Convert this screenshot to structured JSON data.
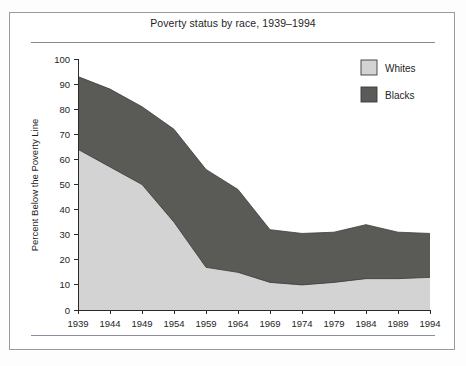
{
  "figure": {
    "title": "Poverty status by race, 1939–1994"
  },
  "axes": {
    "ylabel": "Percent Below the Poverty Line",
    "xlabel": "",
    "y_ticks": [
      "0",
      "10",
      "20",
      "30",
      "40",
      "50",
      "60",
      "70",
      "80",
      "90",
      "100"
    ],
    "x_ticks": [
      "1939",
      "1944",
      "1949",
      "1954",
      "1959",
      "1964",
      "1969",
      "1974",
      "1979",
      "1984",
      "1989",
      "1994"
    ]
  },
  "legend": {
    "position": "top-right",
    "entries": [
      {
        "label": "Whites",
        "color": "#d3d3d3"
      },
      {
        "label": "Blacks",
        "color": "#5a5a56"
      }
    ]
  },
  "colors": {
    "whites_fill": "#d3d3d3",
    "blacks_fill": "#5a5a56",
    "outline": "#3a3a3a",
    "axis": "#2a2a2a",
    "frame": "#9a9a9a",
    "page_background": "#ffffff"
  },
  "chart_data": {
    "type": "area",
    "stacked": false,
    "title": "Poverty status by race, 1939–1994",
    "xlabel": "",
    "ylabel": "Percent Below the Poverty Line",
    "xlim": [
      1939,
      1994
    ],
    "ylim": [
      0,
      100
    ],
    "grid": false,
    "legend_position": "top-right",
    "x": [
      1939,
      1944,
      1949,
      1954,
      1959,
      1964,
      1969,
      1974,
      1979,
      1984,
      1989,
      1994
    ],
    "categories": [
      "1939",
      "1944",
      "1949",
      "1954",
      "1959",
      "1964",
      "1969",
      "1974",
      "1979",
      "1984",
      "1989",
      "1994"
    ],
    "series": [
      {
        "name": "Blacks",
        "color": "#5a5a56",
        "note": "upper boundary of the dark band (percent below poverty line for Blacks)",
        "values": [
          93,
          88,
          81,
          72,
          56,
          48,
          32,
          30.5,
          31,
          34,
          31,
          30.5
        ]
      },
      {
        "name": "Whites",
        "color": "#d3d3d3",
        "note": "upper boundary of the light band (percent below poverty line for Whites)",
        "values": [
          64,
          57,
          50,
          35,
          17,
          15,
          11,
          10,
          11,
          12.5,
          12.5,
          13
        ]
      }
    ]
  }
}
